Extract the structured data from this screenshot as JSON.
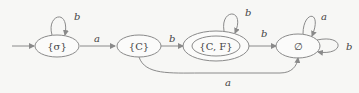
{
  "diagram": {
    "type": "finite-automaton",
    "states": [
      {
        "id": "s0",
        "label": "{σ}",
        "initial": true,
        "accepting": false
      },
      {
        "id": "s1",
        "label": "{C}",
        "initial": false,
        "accepting": false
      },
      {
        "id": "s2",
        "label": "{C, F}",
        "initial": false,
        "accepting": true
      },
      {
        "id": "s3",
        "label": "∅",
        "initial": false,
        "accepting": false
      }
    ],
    "transitions": [
      {
        "from": "s0",
        "to": "s0",
        "symbol": "b"
      },
      {
        "from": "s0",
        "to": "s1",
        "symbol": "a"
      },
      {
        "from": "s1",
        "to": "s2",
        "symbol": "b"
      },
      {
        "from": "s1",
        "to": "s3",
        "symbol": "a"
      },
      {
        "from": "s2",
        "to": "s2",
        "symbol": "b"
      },
      {
        "from": "s2",
        "to": "s3",
        "symbol": "b"
      },
      {
        "from": "s3",
        "to": "s3",
        "symbol": "a"
      },
      {
        "from": "s3",
        "to": "s3",
        "symbol": "b"
      }
    ]
  }
}
